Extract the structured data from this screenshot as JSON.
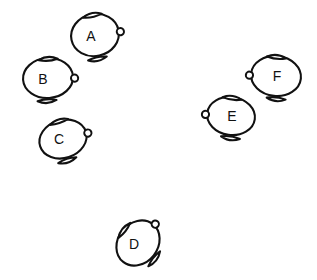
{
  "canvas": {
    "width": 317,
    "height": 280,
    "background_color": "#ffffff",
    "stroke_color": "#111111"
  },
  "diagram": {
    "type": "scatter-of-labeled-objects",
    "object_count": 6,
    "object_kind": "pot-shape",
    "shapes": [
      {
        "id": "shape-a",
        "label": "A",
        "cx": 95,
        "cy": 35,
        "rx": 24,
        "ry": 21,
        "rotation": -12,
        "knob_side": "right",
        "label_x": 91,
        "label_y": 36
      },
      {
        "id": "shape-b",
        "label": "B",
        "cx": 48,
        "cy": 78,
        "rx": 25,
        "ry": 20,
        "rotation": -4,
        "knob_side": "right",
        "label_x": 43,
        "label_y": 79
      },
      {
        "id": "shape-c",
        "label": "C",
        "cx": 63,
        "cy": 139,
        "rx": 24,
        "ry": 19,
        "rotation": -18,
        "knob_side": "right",
        "label_x": 59,
        "label_y": 139
      },
      {
        "id": "shape-d",
        "label": "D",
        "cx": 138,
        "cy": 243,
        "rx": 24,
        "ry": 20,
        "rotation": -52,
        "knob_side": "right",
        "label_x": 134,
        "label_y": 244
      },
      {
        "id": "shape-e",
        "label": "E",
        "cx": 231,
        "cy": 116,
        "rx": 24,
        "ry": 19,
        "rotation": 8,
        "knob_side": "left",
        "label_x": 232,
        "label_y": 116
      },
      {
        "id": "shape-f",
        "label": "F",
        "cx": 276,
        "cy": 76,
        "rx": 25,
        "ry": 20,
        "rotation": 6,
        "knob_side": "left",
        "label_x": 277,
        "label_y": 76
      }
    ]
  }
}
